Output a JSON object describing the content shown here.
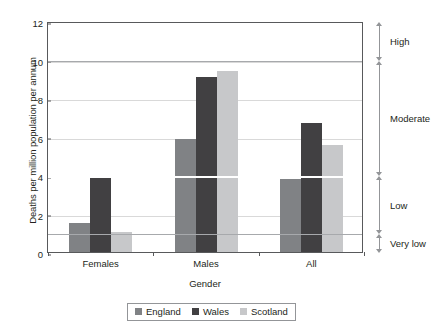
{
  "chart_data": {
    "type": "bar",
    "title": "",
    "xlabel": "Gender",
    "ylabel": "Deaths per million population per annum",
    "categories": [
      "Females",
      "Males",
      "All"
    ],
    "series": [
      {
        "name": "England",
        "color": "#808285",
        "values": [
          1.5,
          5.85,
          3.8
        ]
      },
      {
        "name": "Wales",
        "color": "#414042",
        "values": [
          3.85,
          9.1,
          6.7
        ]
      },
      {
        "name": "Scotland",
        "color": "#c7c8ca",
        "values": [
          1.05,
          9.4,
          5.55
        ]
      }
    ],
    "ylim": [
      0,
      12
    ],
    "yticks": [
      0,
      2,
      4,
      6,
      8,
      10,
      12
    ],
    "ytick_labels": [
      "0",
      "2",
      "4",
      "6",
      "8",
      "10",
      "12"
    ],
    "grid": true,
    "grid_axis": "y",
    "legend_position": "bottom",
    "threshold_lines": [
      {
        "value": 1,
        "style": "grey"
      },
      {
        "value": 4,
        "style": "white"
      },
      {
        "value": 10,
        "style": "grey"
      }
    ],
    "risk_bands": [
      {
        "label": "High",
        "from": 10,
        "to": 12
      },
      {
        "label": "Moderate",
        "from": 4,
        "to": 10
      },
      {
        "label": "Low",
        "from": 1,
        "to": 4
      },
      {
        "label": "Very low",
        "from": 0,
        "to": 1
      }
    ]
  },
  "legend": {
    "items": [
      {
        "label": "England",
        "color": "#808285"
      },
      {
        "label": "Wales",
        "color": "#414042"
      },
      {
        "label": "Scotland",
        "color": "#c7c8ca"
      }
    ]
  }
}
